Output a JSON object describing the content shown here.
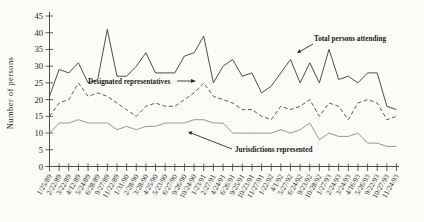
{
  "figure": {
    "ylabel": "Number of persons",
    "annotations": {
      "total": "Total persons attending",
      "designated": "Designated representatives",
      "jurisdictions": "Jurisdictions represented"
    }
  },
  "chart_data": {
    "type": "line",
    "title": "",
    "xlabel": "",
    "ylabel": "Number of persons",
    "ylim": [
      0,
      45
    ],
    "ytick_step": 5,
    "grid": false,
    "legend_position": "inline-annotations",
    "categories": [
      "1/25/89",
      "2/22/89",
      "3/22/89",
      "4/12/89",
      "5/24/89",
      "6/28/89",
      "9/27/89",
      "11/22/89",
      "1/31/90",
      "2/28/90",
      "3/28/90",
      "4/25/90",
      "5/23/90",
      "6/27/90",
      "9/26/90",
      "10/24/90",
      "1/23/91",
      "2/27/91",
      "4/24/91",
      "6/26/91",
      "9/25/91",
      "10/23/91",
      "11/27/91",
      "1/22/92",
      "4/1/92",
      "5/27/92",
      "6/24/92",
      "9/23/92",
      "10/28/92",
      "1/27/93",
      "2/24/93",
      "3/24/93",
      "4/16/93",
      "5/26/93",
      "9/22/93",
      "10/27/93",
      "11/24/93"
    ],
    "series": [
      {
        "name": "Total persons attending",
        "style": "solid",
        "color": "#3b3b3b",
        "values": [
          21,
          29,
          28,
          31,
          25,
          26,
          41,
          27,
          27,
          30,
          34,
          28,
          28,
          28,
          33,
          34,
          39,
          25,
          30,
          32,
          27,
          28,
          22,
          24,
          28,
          32,
          25,
          31,
          25,
          35,
          26,
          27,
          25,
          28,
          28,
          18,
          17
        ]
      },
      {
        "name": "Designated representatives",
        "style": "dashed",
        "color": "#4a4a4a",
        "values": [
          15,
          19,
          20,
          25,
          21,
          22,
          21,
          19,
          17,
          15,
          18,
          19,
          18,
          18,
          20,
          22,
          25,
          21,
          20,
          19,
          17,
          17,
          15,
          14,
          18,
          17,
          18,
          20,
          15,
          19,
          18,
          14,
          19,
          20,
          19,
          14,
          15
        ]
      },
      {
        "name": "Jurisdictions represented",
        "style": "solid",
        "color": "#8c8c8c",
        "values": [
          10,
          13,
          13,
          14,
          13,
          13,
          13,
          11,
          12,
          11,
          12,
          12,
          13,
          13,
          13,
          14,
          14,
          13,
          13,
          10,
          10,
          10,
          10,
          10,
          11,
          10,
          11,
          13,
          8,
          10,
          9,
          9,
          10,
          7,
          7,
          6,
          6
        ]
      }
    ]
  }
}
